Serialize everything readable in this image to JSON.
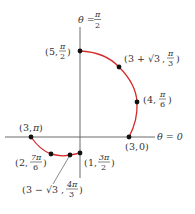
{
  "diagram": {
    "type": "polar-curve",
    "colors": {
      "curve": "#d42a2a",
      "axis": "#6b6b6b",
      "point": "#111111",
      "text": "#333333"
    },
    "axes": {
      "polar_axis_label": "θ = 0",
      "vertical_axis_label_prefix": "θ =",
      "vertical_axis_label_num": "π",
      "vertical_axis_label_den": "2"
    },
    "points": [
      {
        "id": "p1",
        "r": "5",
        "theta_num": "π",
        "theta_den": "2"
      },
      {
        "id": "p2",
        "r": "3 + √3",
        "theta_num": "π",
        "theta_den": "3"
      },
      {
        "id": "p3",
        "r": "4",
        "theta_num": "π",
        "theta_den": "6"
      },
      {
        "id": "p4",
        "r": "3",
        "theta": "0"
      },
      {
        "id": "p5",
        "r": "3",
        "theta": "π"
      },
      {
        "id": "p6",
        "r": "2",
        "theta_num": "7π",
        "theta_den": "6"
      },
      {
        "id": "p7",
        "r": "3 − √3",
        "theta_num": "4π",
        "theta_den": "3"
      },
      {
        "id": "p8",
        "r": "1",
        "theta_num": "3π",
        "theta_den": "2"
      }
    ]
  }
}
